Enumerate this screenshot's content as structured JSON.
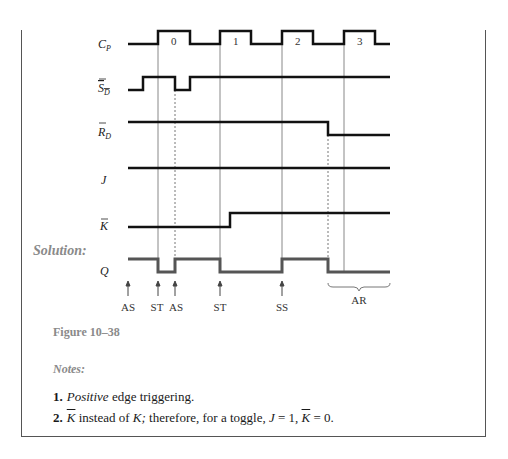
{
  "diagram": {
    "signals": [
      {
        "id": "cp",
        "label": "C",
        "subscript": "P",
        "overbar": false
      },
      {
        "id": "sd",
        "label": "S",
        "subscript": "D",
        "overbar": true
      },
      {
        "id": "rd",
        "label": "R",
        "subscript": "D",
        "overbar": true
      },
      {
        "id": "j",
        "label": "J",
        "subscript": "",
        "overbar": false
      },
      {
        "id": "kbar",
        "label": "K",
        "subscript": "",
        "overbar": true
      },
      {
        "id": "q",
        "label": "Q",
        "subscript": "",
        "overbar": false
      }
    ],
    "clock_pulse_numbers": [
      "0",
      "1",
      "2",
      "3"
    ],
    "events": [
      {
        "label": "AS"
      },
      {
        "label": "ST"
      },
      {
        "label": "AS"
      },
      {
        "label": "ST"
      },
      {
        "label": "SS"
      }
    ],
    "brace_label": "AR",
    "solution_label": "Solution:",
    "colors": {
      "signal": "#111111",
      "q_signal": "#555555",
      "grid": "#888888",
      "caption": "#8a8a8a"
    }
  },
  "caption": "Figure 10–38",
  "notes": {
    "title": "Notes:",
    "items": [
      {
        "number": "1.",
        "emph": "Positive",
        "rest": " edge triggering."
      },
      {
        "number": "2.",
        "k1": "K",
        "t1": " instead of ",
        "k2": "K;",
        "t2": " therefore, for a toggle, ",
        "j": "J",
        "t3": " = 1, ",
        "k3": "K",
        "t4": " = 0."
      }
    ]
  }
}
